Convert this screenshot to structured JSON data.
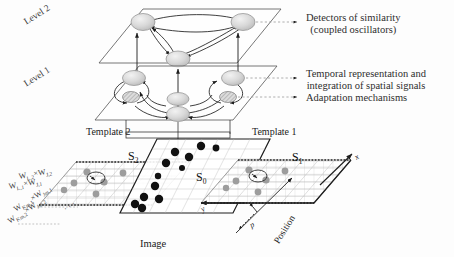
{
  "figure": {
    "background_color": "#fdfdfd",
    "ink_color": "#2b2b2b",
    "type": "hierarchical-network-architecture-diagram"
  },
  "levels": [
    {
      "id": "level2",
      "label": "Level 2",
      "node_count": 3,
      "description": "detectors of similarity plane"
    },
    {
      "id": "level1",
      "label": "Level 1",
      "node_count": 3,
      "adaptation_node_count": 2,
      "description": "temporal representation plane"
    }
  ],
  "annotations": [
    {
      "id": "detectors",
      "line1": "Detectors of similarity",
      "line2": "(coupled oscillators)",
      "target": "level2"
    },
    {
      "id": "temporal",
      "line1": "Temporal representation and",
      "line2": "integration of spatial signals",
      "target": "level1"
    },
    {
      "id": "adaptation",
      "line1": "Adaptation mechanisms",
      "line2": "",
      "target": "level1-hatched-nodes"
    }
  ],
  "planes": {
    "template2": {
      "label": "Template 2",
      "surface_label": "S",
      "surface_sub": "2",
      "dot_color": "#9a9a9a",
      "dot_count": 6
    },
    "image": {
      "label": "Image",
      "surface_label": "S",
      "surface_sub": "0",
      "dot_color": "#111111",
      "dot_count": 12
    },
    "template1": {
      "label": "Template 1",
      "surface_label": "S",
      "surface_sub": "1",
      "dot_color": "#9a9a9a",
      "dot_count": 6
    }
  },
  "weights": {
    "row1": {
      "text": "W",
      "sub1": "L,2",
      "times": "×",
      "text2": "W",
      "sub2": "J,2"
    },
    "row2": {
      "text": "W",
      "sub1": "L,1",
      "times": "×",
      "text2": "W",
      "sub2": "J,1"
    },
    "row3": {
      "text": "W",
      "sub1": "Km,1",
      "times": "×",
      "text2": "W",
      "sub2": "Jm,1"
    },
    "row4": {
      "text": "W",
      "sub1": "Km,2",
      "times": "×",
      "text2": "W",
      "sub2": "Jm,2"
    },
    "ellipsis": "· · ·"
  },
  "axes": {
    "x": "x",
    "y": "y",
    "p": "p",
    "position": "Position"
  },
  "icons": {
    "arrow": "arrow-icon",
    "dashed_leader": "dashed-leader-icon",
    "oscillator": "oscillator-node-icon",
    "hatched": "hatched-node-icon"
  }
}
